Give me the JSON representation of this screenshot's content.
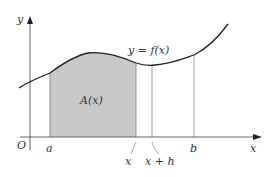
{
  "diagram": {
    "colors": {
      "axis": "#555555",
      "curve": "#222222",
      "shade": "#c8c8c8",
      "guide": "#888888",
      "text": "#333333"
    },
    "labels": {
      "y_axis": "y",
      "x_axis": "x",
      "origin": "O",
      "function": "y = f(x)",
      "area": "A(x)",
      "a": "a",
      "x": "x",
      "x_plus_h": "x + h",
      "b": "b"
    }
  }
}
